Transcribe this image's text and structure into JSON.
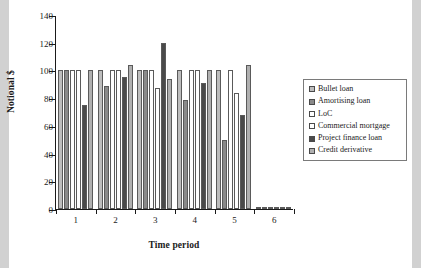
{
  "chart_data": {
    "type": "bar",
    "title": "",
    "xlabel": "Time period",
    "ylabel": "Notional $",
    "categories": [
      "1",
      "2",
      "3",
      "4",
      "5",
      "6"
    ],
    "ylim": [
      0,
      140
    ],
    "yticks": [
      0,
      20,
      40,
      60,
      80,
      100,
      120,
      140
    ],
    "grid": false,
    "legend_position": "right",
    "series": [
      {
        "name": "Bullet loan",
        "color": "#bdbdbd",
        "values": [
          100,
          100,
          100,
          100,
          100,
          0.5
        ]
      },
      {
        "name": "Amortising loan",
        "color": "#8a8a8a",
        "values": [
          100,
          89,
          100,
          79,
          50,
          0.5
        ]
      },
      {
        "name": "LoC",
        "color": "#ffffff",
        "values": [
          100,
          100,
          100,
          100,
          100,
          0.5
        ]
      },
      {
        "name": "Commercial mortgage",
        "color": "#ffffff",
        "values": [
          100,
          100,
          87,
          100,
          84,
          0.5
        ]
      },
      {
        "name": "Project finance loan",
        "color": "#4a4a4a",
        "values": [
          75,
          95,
          120,
          91,
          68,
          0.5
        ]
      },
      {
        "name": "Credit derivative",
        "color": "#b0b0b0",
        "values": [
          100,
          104,
          94,
          100,
          104,
          0.5
        ]
      }
    ]
  }
}
